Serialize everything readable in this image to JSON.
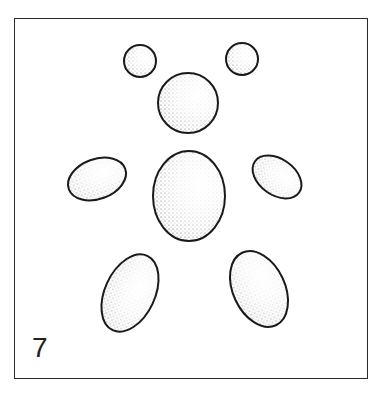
{
  "figure": {
    "label": "7",
    "colors": {
      "stroke": "#1a1a1a",
      "stipple": "#333333",
      "background": "#ffffff"
    },
    "shapes": [
      {
        "name": "left-ear",
        "cx": 140,
        "cy": 61,
        "rx": 16,
        "ry": 16,
        "rot": 0
      },
      {
        "name": "right-ear",
        "cx": 242,
        "cy": 59,
        "rx": 16,
        "ry": 16,
        "rot": 0
      },
      {
        "name": "head",
        "cx": 188,
        "cy": 103,
        "rx": 30,
        "ry": 30,
        "rot": 0
      },
      {
        "name": "body",
        "cx": 189,
        "cy": 196,
        "rx": 36,
        "ry": 45,
        "rot": 0
      },
      {
        "name": "left-arm",
        "cx": 97,
        "cy": 179,
        "rx": 30,
        "ry": 20,
        "rot": -20
      },
      {
        "name": "right-arm",
        "cx": 277,
        "cy": 177,
        "rx": 27,
        "ry": 18,
        "rot": 35
      },
      {
        "name": "left-leg",
        "cx": 130,
        "cy": 293,
        "rx": 25,
        "ry": 41,
        "rot": 25
      },
      {
        "name": "right-leg",
        "cx": 259,
        "cy": 289,
        "rx": 26,
        "ry": 40,
        "rot": -25
      }
    ]
  }
}
